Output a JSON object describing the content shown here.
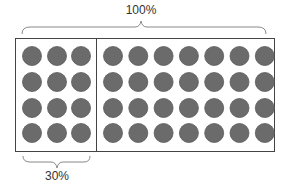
{
  "diagram": {
    "top_label": "100%",
    "bottom_label": "30%",
    "grid": {
      "rows": 4,
      "columns": 10,
      "highlighted_columns": 3
    },
    "colors": {
      "circle": "#6b6b6b",
      "circle_edge": "#5a5a5a",
      "border": "#444444",
      "brace": "#888888",
      "text": "#333333"
    }
  }
}
